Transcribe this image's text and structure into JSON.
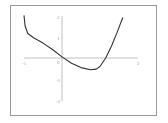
{
  "chart_data": {
    "type": "line",
    "title": "",
    "xlabel": "",
    "ylabel": "",
    "xlim": [
      -1,
      2
    ],
    "ylim": [
      -2,
      2
    ],
    "grid": false,
    "x_ticks": [
      "-1",
      "0",
      "2"
    ],
    "y_ticks": [
      "2",
      "1",
      "0",
      "-1",
      "-2"
    ],
    "series": [
      {
        "name": "f(x)",
        "x": [
          -1.0,
          -0.97,
          -0.9,
          -0.75,
          -0.5,
          -0.25,
          0.0,
          0.25,
          0.5,
          0.75,
          0.9,
          1.0,
          1.15,
          1.3,
          1.45,
          1.6
        ],
        "y": [
          2.0,
          1.5,
          1.15,
          0.95,
          0.7,
          0.4,
          0.05,
          -0.25,
          -0.45,
          -0.55,
          -0.52,
          -0.4,
          0.0,
          0.55,
          1.2,
          1.9
        ]
      }
    ],
    "colors": {
      "curve": "#333333",
      "axes": "#aaaaaa",
      "frame": "#9a9a9a"
    }
  }
}
